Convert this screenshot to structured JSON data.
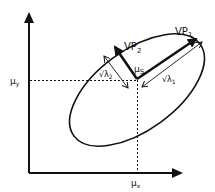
{
  "diagram": {
    "type": "bivariate-gaussian-ellipse",
    "colors": {
      "stroke": "#111111",
      "background": "#ffffff"
    },
    "axes": {
      "x_axis_label": "μx",
      "y_axis_label": "μy"
    },
    "labels": {
      "center": {
        "main": "μ",
        "sub": "S"
      },
      "mu_x": {
        "main": "μ",
        "sub": "x"
      },
      "mu_y": {
        "main": "μ",
        "sub": "y"
      },
      "vp1": {
        "main": "VP",
        "sub": "1"
      },
      "vp2": {
        "main": "VP",
        "sub": "2"
      },
      "sqrt_lambda1": {
        "main": "√λ",
        "sub": "1"
      },
      "sqrt_lambda2": {
        "main": "√λ",
        "sub": "2"
      }
    }
  }
}
